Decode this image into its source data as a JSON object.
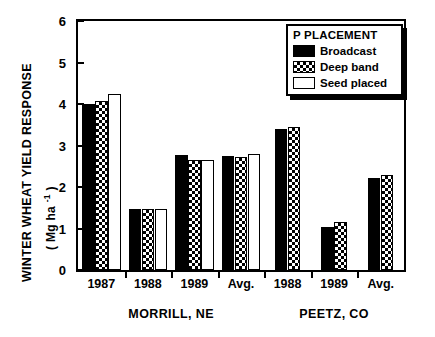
{
  "chart_data": {
    "type": "bar",
    "title": "",
    "xlabel": "",
    "ylabel": "WINTER WHEAT YIELD RESPONSE",
    "ylabel_units": "( Mg ha -1 )",
    "ylim": [
      0,
      6
    ],
    "yticks": [
      0,
      1,
      2,
      3,
      4,
      5,
      6
    ],
    "ytick_labels": [
      "0",
      "1",
      "2",
      "3",
      "4",
      "5",
      "6"
    ],
    "grid": false,
    "legend_position": "top-right",
    "legend_title": "P PLACEMENT",
    "categories": [
      "1987",
      "1988",
      "1989",
      "Avg.",
      "1988",
      "1989",
      "Avg."
    ],
    "group_labels": [
      "MORRILL, NE",
      "PEETZ, CO"
    ],
    "group_spans": [
      [
        0,
        3
      ],
      [
        4,
        6
      ]
    ],
    "series": [
      {
        "name": "Broadcast",
        "fill": "solid-black",
        "values": [
          4.0,
          1.47,
          2.78,
          2.74,
          3.41,
          1.04,
          2.22
        ]
      },
      {
        "name": "Deep band",
        "fill": "crosshatch",
        "values": [
          4.07,
          1.46,
          2.65,
          2.72,
          3.45,
          1.15,
          2.29
        ]
      },
      {
        "name": "Seed placed",
        "fill": "white",
        "values": [
          4.25,
          1.48,
          2.66,
          2.79,
          null,
          null,
          null
        ]
      }
    ]
  },
  "axis": {
    "y_title_main": "WINTER WHEAT YIELD RESPONSE",
    "y_title_units_prefix": "( Mg ha ",
    "y_title_units_sup": "-1",
    "y_title_units_suffix": " )"
  },
  "legend": {
    "title": "P PLACEMENT",
    "entries": [
      {
        "label": "Broadcast",
        "swatch": "solid-black-swatch"
      },
      {
        "label": "Deep band",
        "swatch": "crosshatch-swatch"
      },
      {
        "label": "Seed placed",
        "swatch": "white-swatch"
      }
    ]
  },
  "colors": {
    "ink": "#000000",
    "paper": "#ffffff"
  }
}
